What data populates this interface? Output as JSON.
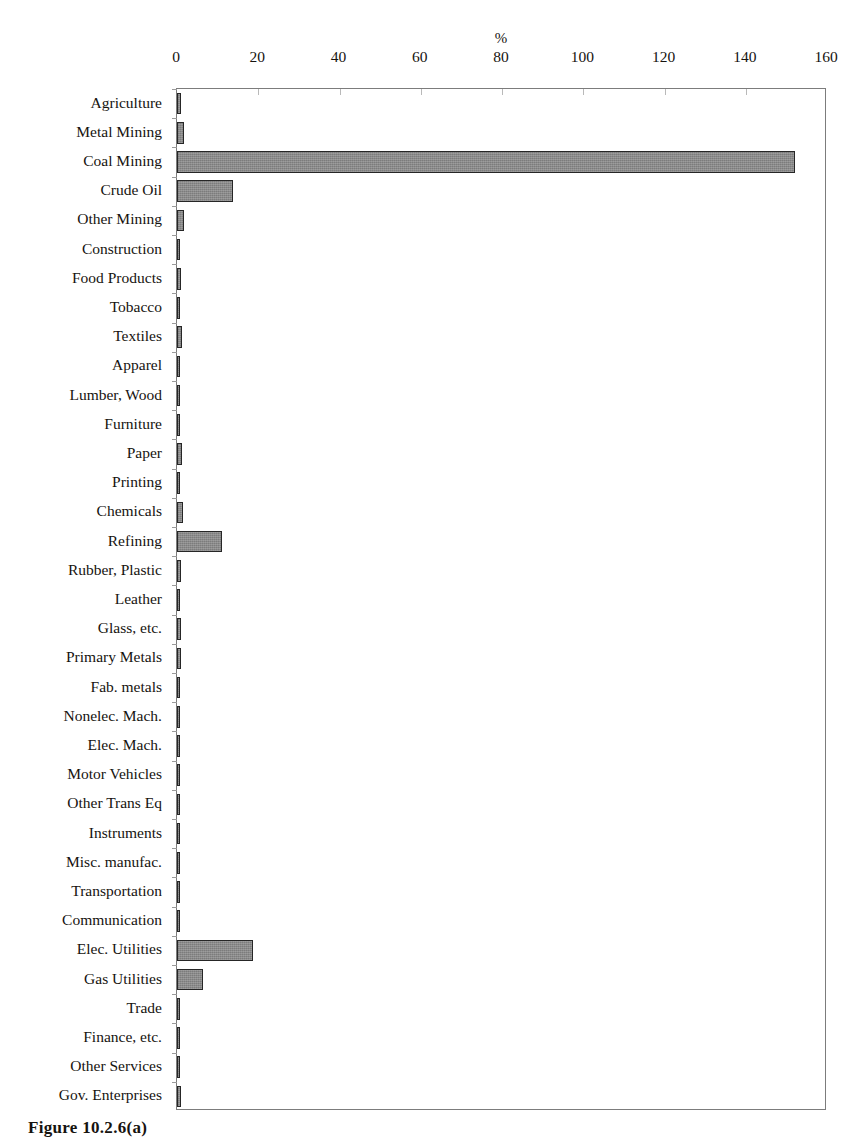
{
  "figure": {
    "caption": "Figure 10.2.6(a)",
    "axis_title": "%"
  },
  "chart_data": {
    "type": "bar",
    "orientation": "horizontal",
    "title": "",
    "subtitle": "",
    "xlabel": "%",
    "ylabel": "",
    "xlim": [
      0,
      160
    ],
    "xticks": [
      0,
      20,
      40,
      60,
      80,
      100,
      120,
      140,
      160
    ],
    "xticklabels": [
      "0",
      "20",
      "40",
      "60",
      "80",
      "100",
      "120",
      "140",
      "160"
    ],
    "grid": false,
    "legend": null,
    "bar_color": "#8a8a8a",
    "bar_edge_color": "#262626",
    "categories": [
      "Agriculture",
      "Metal Mining",
      "Coal Mining",
      "Crude Oil",
      "Other Mining",
      "Construction",
      "Food Products",
      "Tobacco",
      "Textiles",
      "Apparel",
      "Lumber, Wood",
      "Furniture",
      "Paper",
      "Printing",
      "Chemicals",
      "Refining",
      "Rubber, Plastic",
      "Leather",
      "Glass, etc.",
      "Primary Metals",
      "Fab. metals",
      "Nonelec. Mach.",
      "Elec. Mach.",
      "Motor Vehicles",
      "Other Trans Eq",
      "Instruments",
      "Misc. manufac.",
      "Transportation",
      "Communication",
      "Elec. Utilities",
      "Gas Utilities",
      "Trade",
      "Finance, etc.",
      "Other Services",
      "Gov. Enterprises"
    ],
    "values": [
      1.0,
      1.7,
      152.0,
      13.8,
      1.6,
      0.5,
      0.9,
      0.8,
      1.2,
      0.3,
      0.6,
      0.3,
      1.2,
      0.4,
      1.5,
      11.0,
      0.9,
      0.3,
      1.1,
      1.1,
      0.6,
      0.3,
      0.3,
      0.3,
      0.2,
      0.6,
      0.3,
      0.8,
      0.3,
      18.7,
      6.3,
      0.3,
      0.4,
      0.3,
      1.0
    ]
  }
}
